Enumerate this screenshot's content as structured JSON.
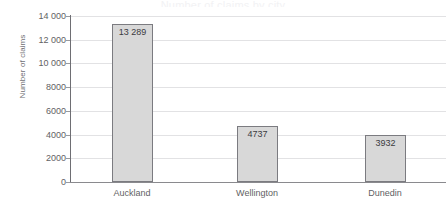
{
  "title_remnant": "Number of claims by city",
  "chart_data": {
    "type": "bar",
    "title": "",
    "xlabel": "",
    "ylabel": "Number of claims",
    "categories": [
      "Auckland",
      "Wellington",
      "Dunedin"
    ],
    "values": [
      13289,
      4737,
      3932
    ],
    "value_labels": [
      "13 289",
      "4737",
      "3932"
    ],
    "ylim": [
      0,
      14000
    ],
    "ytick_values": [
      0,
      2000,
      4000,
      6000,
      8000,
      10000,
      12000,
      14000
    ],
    "ytick_labels": [
      "0",
      "2000",
      "4000",
      "6000",
      "8000",
      "10 000",
      "12 000",
      "14 000"
    ],
    "grid": true,
    "grid_axis": "y",
    "legend": false,
    "bar_fill_color": "#d8d8d8",
    "bar_border_color": "#7b7b80",
    "gridline_color": "#e2e2e4",
    "axis_color": "#6e6e73",
    "text_color": "#5f5f64"
  }
}
